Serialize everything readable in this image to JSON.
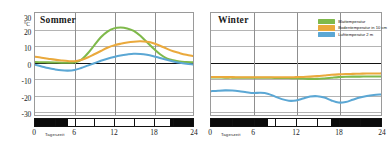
{
  "figure": {
    "unit_label": "°C",
    "x_axis_title": "Tageszeit"
  },
  "legend": {
    "position": "top-right",
    "entries": [
      {
        "label": "Blattemperatur",
        "color": "#7fb94b"
      },
      {
        "label": "Bodentemperatur in 10 cm",
        "color": "#eaa93c"
      },
      {
        "label": "Lufttemperatur 2 m",
        "color": "#5ba7d4"
      }
    ]
  },
  "panels": [
    {
      "id": "sommer",
      "title": "Sommer"
    },
    {
      "id": "winter",
      "title": "Winter"
    }
  ],
  "axes": {
    "y_ticks": [
      "30",
      "20",
      "10",
      "0",
      "-10",
      "-20",
      "-30"
    ],
    "x_ticks": [
      "0",
      "6",
      "12",
      "18",
      "24"
    ]
  },
  "chart_data": {
    "type": "line",
    "xlabel": "Tageszeit",
    "ylabel": "°C",
    "xlim": [
      0,
      24
    ],
    "ylim": [
      -33,
      30
    ],
    "grid": true,
    "legend_position": "top-right",
    "panels": [
      {
        "name": "Sommer",
        "x": [
          0,
          1,
          2,
          3,
          4,
          5,
          6,
          7,
          8,
          9,
          10,
          11,
          12,
          13,
          14,
          15,
          16,
          17,
          18,
          19,
          20,
          21,
          22,
          23,
          24
        ],
        "series": [
          {
            "name": "Blattemperatur",
            "color": "#7fb94b",
            "values": [
              -0.3,
              -0.4,
              -0.5,
              -0.6,
              -0.7,
              -0.7,
              -0.5,
              1.0,
              5.0,
              10.0,
              15.0,
              18.5,
              20.5,
              21.0,
              20.5,
              19.0,
              16.0,
              12.0,
              8.0,
              4.5,
              2.0,
              0.8,
              0.0,
              -0.3,
              -0.5
            ]
          },
          {
            "name": "Bodentemperatur in 10 cm",
            "color": "#eaa93c",
            "values": [
              3.0,
              2.4,
              1.8,
              1.2,
              0.7,
              0.3,
              0.2,
              1.0,
              2.5,
              4.5,
              6.5,
              8.5,
              10.0,
              11.0,
              11.8,
              12.3,
              12.5,
              12.2,
              11.3,
              9.8,
              8.0,
              6.4,
              5.2,
              4.2,
              3.4
            ]
          },
          {
            "name": "Lufttemperatur 2 m",
            "color": "#5ba7d4",
            "values": [
              -2.0,
              -3.0,
              -4.0,
              -4.8,
              -5.4,
              -5.6,
              -5.2,
              -4.0,
              -2.5,
              -1.0,
              0.5,
              1.8,
              2.9,
              3.8,
              4.4,
              4.8,
              4.7,
              4.2,
              3.3,
              2.2,
              1.1,
              0.1,
              -0.7,
              -1.3,
              -1.8
            ]
          }
        ],
        "daynight": [
          {
            "type": "night",
            "from": 0,
            "to": 5.0
          },
          {
            "type": "day",
            "from": 5.0,
            "to": 20.5
          },
          {
            "type": "night",
            "from": 20.5,
            "to": 24
          }
        ]
      },
      {
        "name": "Winter",
        "x": [
          0,
          1,
          2,
          3,
          4,
          5,
          6,
          7,
          8,
          9,
          10,
          11,
          12,
          13,
          14,
          15,
          16,
          17,
          18,
          19,
          20,
          21,
          22,
          23,
          24
        ],
        "series": [
          {
            "name": "Blattemperatur",
            "color": "#7fb94b",
            "values": [
              -9.8,
              -9.8,
              -9.9,
              -9.9,
              -10.0,
              -10.0,
              -10.0,
              -10.0,
              -10.0,
              -10.1,
              -10.1,
              -10.2,
              -10.3,
              -10.5,
              -10.7,
              -10.7,
              -10.4,
              -10.0,
              -9.6,
              -9.4,
              -9.3,
              -9.3,
              -9.2,
              -9.2,
              -9.2
            ]
          },
          {
            "name": "Bodentemperatur in 10 cm",
            "color": "#eaa93c",
            "values": [
              -9.5,
              -9.5,
              -9.6,
              -9.6,
              -9.7,
              -9.7,
              -9.7,
              -9.7,
              -9.7,
              -9.7,
              -9.7,
              -9.7,
              -9.6,
              -9.5,
              -9.3,
              -9.0,
              -8.6,
              -8.2,
              -7.9,
              -7.7,
              -7.6,
              -7.5,
              -7.4,
              -7.4,
              -7.3
            ]
          },
          {
            "name": "Lufttemperatur 2 m",
            "color": "#5ba7d4",
            "values": [
              -18.3,
              -18.0,
              -17.8,
              -17.9,
              -18.3,
              -18.9,
              -19.4,
              -19.3,
              -19.8,
              -21.5,
              -23.2,
              -24.2,
              -24.0,
              -22.8,
              -21.6,
              -21.4,
              -22.2,
              -24.0,
              -25.3,
              -25.0,
              -23.6,
              -22.2,
              -21.2,
              -20.6,
              -20.3
            ]
          }
        ],
        "daynight": [
          {
            "type": "night",
            "from": 0,
            "to": 8.0
          },
          {
            "type": "day",
            "from": 8.0,
            "to": 17.0
          },
          {
            "type": "night",
            "from": 17.0,
            "to": 24
          }
        ]
      }
    ]
  }
}
